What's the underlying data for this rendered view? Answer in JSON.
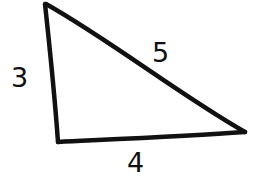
{
  "diagram": {
    "type": "right-triangle",
    "stroke_color": "#111111",
    "background": "#ffffff",
    "vertices": {
      "top": [
        45,
        3
      ],
      "bottom_left": [
        58,
        143
      ],
      "right": [
        246,
        132
      ]
    },
    "labels": {
      "left_side": "3",
      "hypotenuse": "5",
      "bottom_side": "4"
    }
  }
}
